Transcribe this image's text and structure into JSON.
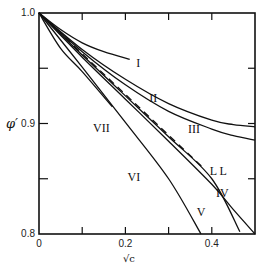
{
  "chart_data": {
    "type": "line",
    "title": "",
    "xlabel": "√c",
    "ylabel": "φ′",
    "xlim": [
      0,
      0.5
    ],
    "ylim": [
      0.8,
      1.0
    ],
    "grid": false,
    "legend": "inline curve labels",
    "x_ticks": [
      {
        "value": 0,
        "label": "0"
      },
      {
        "value": 0.1,
        "label": ""
      },
      {
        "value": 0.2,
        "label": "0.2"
      },
      {
        "value": 0.3,
        "label": ""
      },
      {
        "value": 0.4,
        "label": "0.4"
      }
    ],
    "y_ticks": [
      {
        "value": 0.8,
        "label": "0.8"
      },
      {
        "value": 0.85,
        "label": ""
      },
      {
        "value": 0.9,
        "label": "0.9"
      },
      {
        "value": 0.95,
        "label": ""
      },
      {
        "value": 1.0,
        "label": "1.0"
      }
    ],
    "series": [
      {
        "name": "I",
        "style": "solid",
        "x": [
          0,
          0.05,
          0.1,
          0.15,
          0.21
        ],
        "y": [
          1.0,
          0.985,
          0.973,
          0.965,
          0.958
        ],
        "label_pos": [
          0.225,
          0.955
        ]
      },
      {
        "name": "II",
        "style": "solid",
        "x": [
          0,
          0.1,
          0.2,
          0.3,
          0.4,
          0.45,
          0.5
        ],
        "y": [
          1.0,
          0.967,
          0.94,
          0.918,
          0.903,
          0.899,
          0.897
        ],
        "label_pos": [
          0.255,
          0.923
        ]
      },
      {
        "name": "III",
        "style": "solid",
        "x": [
          0,
          0.1,
          0.2,
          0.3,
          0.4,
          0.45,
          0.5
        ],
        "y": [
          1.0,
          0.965,
          0.935,
          0.911,
          0.895,
          0.889,
          0.885
        ],
        "label_pos": [
          0.345,
          0.895
        ]
      },
      {
        "name": "LL",
        "style": "dashed",
        "x": [
          0,
          0.38
        ],
        "y": [
          1.0,
          0.86
        ],
        "label_pos": [
          0.395,
          0.857
        ]
      },
      {
        "name": "IV",
        "style": "solid",
        "x": [
          0,
          0.1,
          0.2,
          0.3,
          0.4,
          0.465
        ],
        "y": [
          1.0,
          0.962,
          0.925,
          0.888,
          0.85,
          0.802
        ],
        "label_pos": [
          0.41,
          0.837
        ]
      },
      {
        "name": "V",
        "style": "solid",
        "x": [
          0,
          0.1,
          0.2,
          0.3,
          0.4,
          0.45,
          0.5
        ],
        "y": [
          1.0,
          0.96,
          0.922,
          0.884,
          0.845,
          0.822,
          0.8
        ],
        "label_pos": [
          0.365,
          0.82
        ]
      },
      {
        "name": "VI",
        "style": "solid",
        "x": [
          0,
          0.1,
          0.2,
          0.3,
          0.375
        ],
        "y": [
          1.0,
          0.951,
          0.901,
          0.85,
          0.8
        ],
        "label_pos": [
          0.205,
          0.852
        ]
      },
      {
        "name": "VII",
        "style": "solid",
        "x": [
          0,
          0.05,
          0.1,
          0.17
        ],
        "y": [
          1.0,
          0.968,
          0.947,
          0.915
        ],
        "label_pos": [
          0.125,
          0.896
        ]
      }
    ]
  },
  "colors": {
    "line": "#111111",
    "background": "#ffffff"
  }
}
